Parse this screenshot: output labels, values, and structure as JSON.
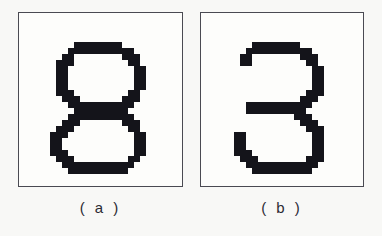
{
  "figure": {
    "kind": "pixelated-digit-bitmaps",
    "background_color": "#f8f8f6",
    "panel_background_color": "#fdfdfb",
    "panel_border_color": "#4a4a52",
    "ink_color": "#14141a",
    "caption_color": "#2b2b33"
  },
  "panels": [
    {
      "id": "a",
      "caption": "( a )",
      "digit_label": "8",
      "cell_size": 6,
      "grid_cols": 17,
      "grid_rows": 24,
      "pixels": [
        "00000000000000000",
        "00000000000000000",
        "00000111111110000",
        "00001111111111100",
        "00011000000001110",
        "00111000000000110",
        "00110000000000011",
        "00110000000000011",
        "00110000000000011",
        "00110000000000011",
        "00111000000000110",
        "00011100000001110",
        "00001111111111100",
        "00000111111111000",
        "00001111111111100",
        "00011100000001110",
        "00111000000000110",
        "01110000000000011",
        "01100000000000011",
        "01100000000000011",
        "01110000000000011",
        "00111000000000110",
        "00011111111111100",
        "00001111111111000"
      ]
    },
    {
      "id": "b",
      "caption": "( b )",
      "digit_label": "3",
      "cell_size": 6,
      "grid_cols": 18,
      "grid_rows": 24,
      "pixels": [
        "000000000000000000",
        "000000000000000000",
        "000001111111100000",
        "000011111111111000",
        "000110000000011100",
        "000110000000001100",
        "000000000000000110",
        "000000000000000110",
        "000000000000000110",
        "000000000000000110",
        "000000000000001110",
        "000000000000011100",
        "000011111111111000",
        "000011111111110000",
        "000000000000111000",
        "000000000000011100",
        "000000000000001110",
        "001100000000000110",
        "001100000000000110",
        "001100000000000110",
        "001110000000000110",
        "000111000000001110",
        "000011111111111100",
        "000001111111111000"
      ]
    }
  ]
}
